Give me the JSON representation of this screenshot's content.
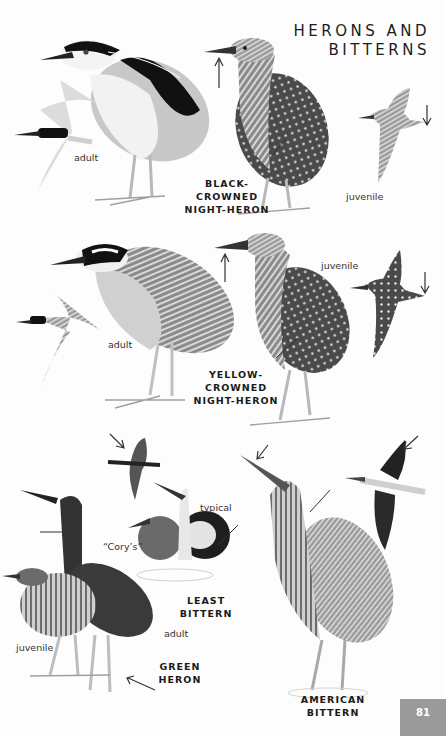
{
  "header": {
    "title_line1": "HERONS AND",
    "title_line2": "BITTERNS"
  },
  "species": [
    {
      "id": "black-crowned-night-heron",
      "name_line1": "BLACK-CROWNED",
      "name_line2": "NIGHT-HERON",
      "labels": [
        "adult",
        "juvenile"
      ]
    },
    {
      "id": "yellow-crowned-night-heron",
      "name_line1": "YELLOW-CROWNED",
      "name_line2": "NIGHT-HERON",
      "labels": [
        "adult",
        "juvenile"
      ]
    },
    {
      "id": "least-bittern",
      "name_line1": "LEAST",
      "name_line2": "BITTERN",
      "labels": [
        "typical",
        "“Cory’s”"
      ]
    },
    {
      "id": "green-heron",
      "name_line1": "GREEN HERON",
      "labels": [
        "adult",
        "juvenile"
      ]
    },
    {
      "id": "american-bittern",
      "name_line1": "AMERICAN",
      "name_line2": "BITTERN",
      "labels": []
    }
  ],
  "footer": {
    "page_number": "81"
  },
  "colors": {
    "ink": "#1a1a1a",
    "folio_bg": "#9a9a9a",
    "paper": "#fdfdfd"
  }
}
